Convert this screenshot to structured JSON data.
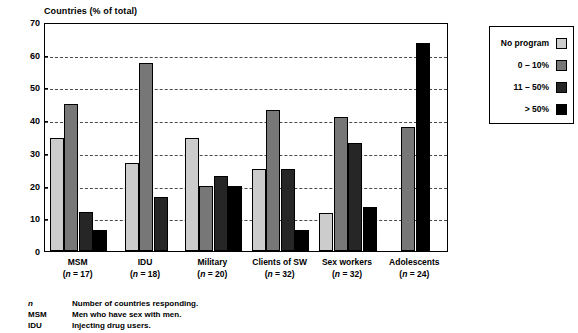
{
  "chart_data": {
    "type": "bar",
    "title": "Countries (% of total)",
    "xlabel": "",
    "ylabel": "Countries (% of total)",
    "ylim": [
      0,
      70
    ],
    "ytick_step": 10,
    "yticks": [
      0,
      10,
      20,
      30,
      40,
      50,
      60,
      70
    ],
    "grid": true,
    "grid_style": "dashed-horizontal",
    "legend_position": "right-outside",
    "categories": [
      "MSM",
      "IDU",
      "Military",
      "Clients of SW",
      "Sex workers",
      "Adolescents"
    ],
    "category_notes": [
      "(n = 17)",
      "(n = 18)",
      "(n = 20)",
      "(n = 32)",
      "(n = 32)",
      "(n = 24)"
    ],
    "n_values": [
      17,
      18,
      20,
      32,
      32,
      24
    ],
    "series": [
      {
        "name": "No program",
        "color": "#cccccc",
        "values": [
          34.5,
          27,
          34.5,
          25,
          11.5,
          null
        ]
      },
      {
        "name": "0 – 10%",
        "color": "#777777",
        "values": [
          45,
          57.5,
          20,
          43,
          41,
          38
        ]
      },
      {
        "name": "11 – 50%",
        "color": "#262626",
        "values": [
          12,
          16.5,
          23,
          25,
          33,
          null
        ]
      },
      {
        "name": "> 50%",
        "color": "#000000",
        "values": [
          6.5,
          null,
          20,
          6.5,
          13.5,
          63.5
        ]
      }
    ]
  },
  "legend": {
    "entries": [
      {
        "label": "No program",
        "color": "#cccccc"
      },
      {
        "label": "0 – 10%",
        "color": "#777777"
      },
      {
        "label": "11 – 50%",
        "color": "#262626"
      },
      {
        "label": "> 50%",
        "color": "#000000"
      }
    ]
  },
  "footnotes": [
    {
      "key": "n",
      "text": "Number of countries responding.",
      "italic": true
    },
    {
      "key": "MSM",
      "text": "Men who have sex with men.",
      "italic": false
    },
    {
      "key": "IDU",
      "text": "Injecting drug users.",
      "italic": false
    }
  ]
}
